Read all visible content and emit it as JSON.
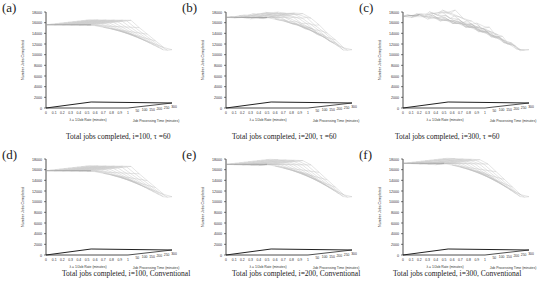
{
  "figure": {
    "panels": [
      {
        "label": "(a)",
        "caption": "Total jobs completed, i=100, τ =60",
        "plateau": 15600,
        "floor": 10000,
        "knee": 0.55,
        "noise": 0
      },
      {
        "label": "(b)",
        "caption": "Total jobs completed, i=200, τ =60",
        "plateau": 17000,
        "floor": 10000,
        "knee": 0.5,
        "noise": 0.3
      },
      {
        "label": "(c)",
        "caption": "Total jobs completed, i=300, τ =60",
        "plateau": 17200,
        "floor": 10000,
        "knee": 0.2,
        "noise": 1
      },
      {
        "label": "(d)",
        "caption": "Total jobs completed, i=100, Conventional",
        "plateau": 15800,
        "floor": 10000,
        "knee": 0.55,
        "noise": 0
      },
      {
        "label": "(e)",
        "caption": "Total jobs completed, i=200, Conventional",
        "plateau": 17000,
        "floor": 10000,
        "knee": 0.5,
        "noise": 0
      },
      {
        "label": "(f)",
        "caption": "Total jobs completed, i=300, Conventional",
        "plateau": 17200,
        "floor": 10000,
        "knee": 0.5,
        "noise": 0
      }
    ]
  },
  "axes": {
    "z_label": "Number Jobs Completed",
    "z_ticks": [
      "0",
      "2000",
      "4000",
      "6000",
      "8000",
      "10000",
      "12000",
      "14000",
      "16000",
      "18000"
    ],
    "x_label": "λ = 1/Job Rate (minutes)",
    "x_ticks": [
      "0",
      "0.1",
      "0.2",
      "0.3",
      "0.4",
      "0.5",
      "0.6",
      "0.7",
      "0.8",
      "0.9",
      "1"
    ],
    "y_label": "Job Processing Time (minutes)",
    "y_ticks": [
      "50",
      "100",
      "150",
      "200",
      "250",
      "300"
    ]
  },
  "chart_data": [
    {
      "type": "surface",
      "title": "(a) Total jobs completed, i=100, τ =60",
      "xlabel": "λ = 1/Job Rate (minutes)",
      "ylabel": "Job Processing Time (minutes)",
      "zlabel": "Number Jobs Completed",
      "x_range": [
        0,
        1
      ],
      "y_range": [
        0,
        300
      ],
      "z_range": [
        0,
        18000
      ],
      "plateau_value": 15600,
      "min_value": 10000,
      "grid": false
    },
    {
      "type": "surface",
      "title": "(b) Total jobs completed, i=200, τ =60",
      "xlabel": "λ = 1/Job Rate (minutes)",
      "ylabel": "Job Processing Time (minutes)",
      "zlabel": "Number Jobs Completed",
      "x_range": [
        0,
        1
      ],
      "y_range": [
        0,
        300
      ],
      "z_range": [
        0,
        18000
      ],
      "plateau_value": 17000,
      "min_value": 10000,
      "grid": false
    },
    {
      "type": "surface",
      "title": "(c) Total jobs completed, i=300, τ =60",
      "xlabel": "λ = 1/Job Rate (minutes)",
      "ylabel": "Job Processing Time (minutes)",
      "zlabel": "Number Jobs Completed",
      "x_range": [
        0,
        1
      ],
      "y_range": [
        0,
        300
      ],
      "z_range": [
        0,
        18000
      ],
      "plateau_value": 17200,
      "min_value": 10000,
      "grid": false
    },
    {
      "type": "surface",
      "title": "(d) Total jobs completed, i=100, Conventional",
      "xlabel": "λ = 1/Job Rate (minutes)",
      "ylabel": "Job Processing Time (minutes)",
      "zlabel": "Number Jobs Completed",
      "x_range": [
        0,
        1
      ],
      "y_range": [
        0,
        300
      ],
      "z_range": [
        0,
        18000
      ],
      "plateau_value": 15800,
      "min_value": 10000,
      "grid": false
    },
    {
      "type": "surface",
      "title": "(e) Total jobs completed, i=200, Conventional",
      "xlabel": "λ = 1/Job Rate (minutes)",
      "ylabel": "Job Processing Time (minutes)",
      "zlabel": "Number Jobs Completed",
      "x_range": [
        0,
        1
      ],
      "y_range": [
        0,
        300
      ],
      "z_range": [
        0,
        18000
      ],
      "plateau_value": 17000,
      "min_value": 10000,
      "grid": false
    },
    {
      "type": "surface",
      "title": "(f) Total jobs completed, i=300, Conventional",
      "xlabel": "λ = 1/Job Rate (minutes)",
      "ylabel": "Job Processing Time (minutes)",
      "zlabel": "Number Jobs Completed",
      "x_range": [
        0,
        1
      ],
      "y_range": [
        0,
        300
      ],
      "z_range": [
        0,
        18000
      ],
      "plateau_value": 17200,
      "min_value": 10000,
      "grid": false
    }
  ]
}
